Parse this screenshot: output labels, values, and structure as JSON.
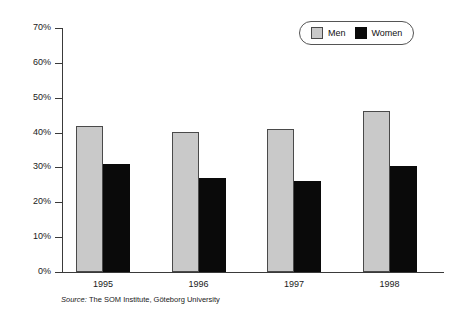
{
  "chart_data": {
    "type": "bar",
    "title": "",
    "subtitle": "",
    "xlabel": "",
    "ylabel": "",
    "categories": [
      "1995",
      "1996",
      "1997",
      "1998"
    ],
    "series": [
      {
        "name": "Men",
        "color": "#c9c9c9",
        "values": [
          42.0,
          40.2,
          41.0,
          46.3
        ]
      },
      {
        "name": "Women",
        "color": "#0a0a0a",
        "values": [
          31.0,
          27.0,
          26.2,
          30.4
        ]
      }
    ],
    "ylim": [
      0,
      70
    ],
    "ytick_values": [
      0,
      10,
      20,
      30,
      40,
      50,
      60,
      70
    ],
    "ytick_labels": [
      "0%",
      "10%",
      "20%",
      "30%",
      "40%",
      "50%",
      "60%",
      "70%"
    ],
    "grid": false,
    "legend_position": "top-right",
    "legend_entries": [
      "Men",
      "Women"
    ],
    "annotations": []
  },
  "legend": {
    "entries": [
      {
        "label": "Men",
        "swatch": "men-swatch"
      },
      {
        "label": "Women",
        "swatch": "women-swatch"
      }
    ]
  },
  "source": {
    "prefix": "Source:",
    "text": "The SOM Institute, Göteborg University"
  }
}
